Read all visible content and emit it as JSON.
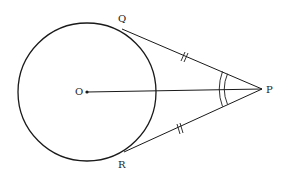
{
  "diagram": {
    "type": "geometry",
    "stroke_color": "#1a1a1a",
    "circle": {
      "center_label": "O",
      "cx": 87,
      "cy": 92,
      "r": 69
    },
    "points": {
      "O": {
        "label": "O",
        "x": 87,
        "y": 92
      },
      "P": {
        "label": "P",
        "x": 262,
        "y": 89
      },
      "Q": {
        "label": "Q",
        "x": 125,
        "y": 31
      },
      "R": {
        "label": "R",
        "x": 127,
        "y": 151
      }
    },
    "segments": [
      {
        "name": "PQ",
        "from": "P",
        "to": "Q",
        "tick_marks": 2
      },
      {
        "name": "PR",
        "from": "P",
        "to": "R",
        "tick_marks": 2
      },
      {
        "name": "OP",
        "from": "O",
        "to": "P",
        "tick_marks": 0
      }
    ],
    "angle_marks": [
      {
        "vertex": "P",
        "between": [
          "Q",
          "R"
        ],
        "arcs": 2,
        "note": "angle QPO equals angle RPO"
      }
    ],
    "labels": {
      "O": "O",
      "P": "P",
      "Q": "Q",
      "R": "R"
    }
  }
}
